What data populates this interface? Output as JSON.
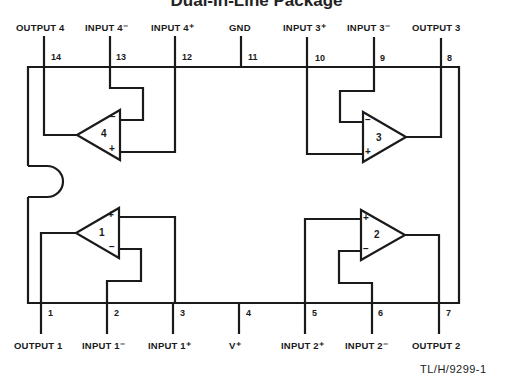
{
  "title": "Dual-In-Line Package",
  "reference": "TL/H/9299-1",
  "top_pins": [
    {
      "num": "14",
      "label": "OUTPUT 4",
      "x": 44
    },
    {
      "num": "13",
      "label": "INPUT 4⁻",
      "x": 110
    },
    {
      "num": "12",
      "label": "INPUT 4⁺",
      "x": 175
    },
    {
      "num": "11",
      "label": "GND",
      "x": 241
    },
    {
      "num": "10",
      "label": "INPUT 3⁺",
      "x": 307
    },
    {
      "num": "9",
      "label": "INPUT 3⁻",
      "x": 374
    },
    {
      "num": "8",
      "label": "OUTPUT 3",
      "x": 441
    }
  ],
  "bottom_pins": [
    {
      "num": "1",
      "label": "OUTPUT 1",
      "x": 41
    },
    {
      "num": "2",
      "label": "INPUT 1⁻",
      "x": 107
    },
    {
      "num": "3",
      "label": "INPUT 1⁺",
      "x": 173
    },
    {
      "num": "4",
      "label": "V⁺",
      "x": 239
    },
    {
      "num": "5",
      "label": "INPUT 2⁺",
      "x": 305
    },
    {
      "num": "6",
      "label": "INPUT 2⁻",
      "x": 372
    },
    {
      "num": "7",
      "label": "OUTPUT 2",
      "x": 439
    }
  ],
  "amplifiers": [
    {
      "id": "1",
      "plus": "+",
      "minus": "−"
    },
    {
      "id": "2",
      "plus": "+",
      "minus": "−"
    },
    {
      "id": "3",
      "plus": "+",
      "minus": "−"
    },
    {
      "id": "4",
      "plus": "+",
      "minus": "−"
    }
  ],
  "colors": {
    "ink": "#1a1a1a",
    "background": "#ffffff"
  }
}
